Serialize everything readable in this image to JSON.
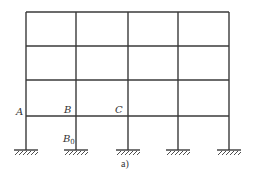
{
  "figure": {
    "caption": "a)",
    "stroke_color": "#3a3a3a",
    "frame": {
      "columns_x": [
        26,
        76,
        128,
        178,
        229
      ],
      "upper_beams_y": [
        12,
        46,
        80
      ],
      "ground_floor_beam_y": 116,
      "ground_y": 150
    },
    "labels": {
      "A": "A",
      "B": "B",
      "C": "C",
      "B0_main": "B",
      "B0_sub": "0"
    }
  }
}
